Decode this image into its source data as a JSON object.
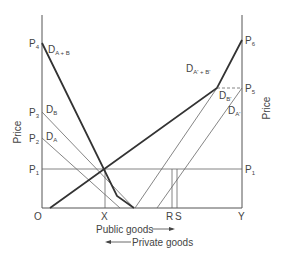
{
  "diagram": {
    "y_axis_left_label": "Price",
    "y_axis_right_label": "Price",
    "origin_label": "O",
    "x_labels": {
      "x": "X",
      "r": "R",
      "s": "S",
      "y": "Y"
    },
    "x_axis_caption_public": "Public goods",
    "x_axis_caption_private": "Private goods",
    "left_price_labels": {
      "p4": {
        "main": "P",
        "sub": "4"
      },
      "p3": {
        "main": "P",
        "sub": "3"
      },
      "p2": {
        "main": "P",
        "sub": "2"
      },
      "p1": {
        "main": "P",
        "sub": "1"
      }
    },
    "right_price_labels": {
      "p6": {
        "main": "P",
        "sub": "6"
      },
      "p5": {
        "main": "P",
        "sub": "5"
      },
      "p1": {
        "main": "P",
        "sub": "1"
      }
    },
    "curve_labels": {
      "d_a_plus_b": {
        "main": "D",
        "sub": "A + B"
      },
      "d_b": {
        "main": "D",
        "sub": "B"
      },
      "d_a": {
        "main": "D",
        "sub": "A"
      },
      "d_a_prime_plus_b_prime": {
        "main": "D",
        "sub": "A' + B'"
      },
      "d_b_prime": {
        "main": "D",
        "sub": "B'"
      },
      "d_a_prime": {
        "main": "D",
        "sub": "A'"
      }
    },
    "colors": {
      "thin_line": "#555555",
      "bold_line": "#333333",
      "text": "#444444"
    }
  }
}
